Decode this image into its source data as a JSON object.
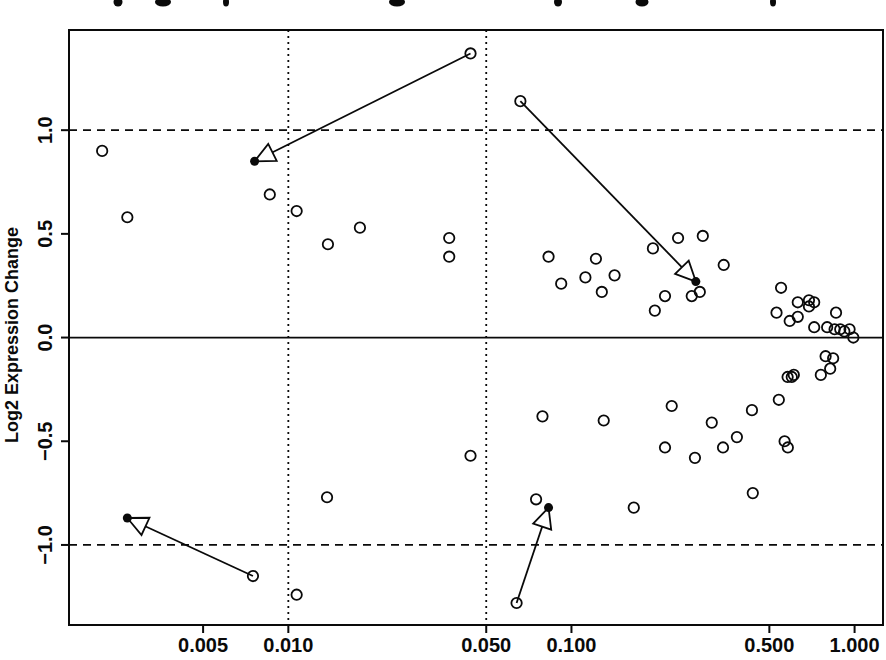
{
  "chart_data": {
    "type": "scatter",
    "title": "",
    "title_clipped_at_top": true,
    "xlabel": "",
    "ylabel": "Log2 Expression Change",
    "x_scale": "log10",
    "xlim": [
      0.00168,
      1.26
    ],
    "ylim": [
      -1.386,
      1.483
    ],
    "grid": false,
    "x_ticks": [
      0.005,
      0.01,
      0.05,
      0.1,
      0.5,
      1.0
    ],
    "x_tick_labels": [
      "0.005",
      "0.010",
      "0.050",
      "0.100",
      "0.500",
      "1.000"
    ],
    "y_ticks": [
      1.0,
      0.5,
      0.0,
      -0.5,
      -1.0
    ],
    "y_tick_labels": [
      "1.0",
      "0.5",
      "0.0",
      "−0.5",
      "−1.0"
    ],
    "reference_lines": {
      "horizontal_solid": [
        0
      ],
      "horizontal_dashed": [
        1.0,
        -1.0
      ],
      "vertical_dotted": [
        0.01,
        0.05
      ]
    },
    "points": [
      [
        0.0022,
        0.9
      ],
      [
        0.0027,
        0.58
      ],
      [
        0.0086,
        0.69
      ],
      [
        0.0107,
        0.61
      ],
      [
        0.0138,
        0.45
      ],
      [
        0.0179,
        0.53
      ],
      [
        0.037,
        0.48
      ],
      [
        0.037,
        0.39
      ],
      [
        0.083,
        0.39
      ],
      [
        0.092,
        0.26
      ],
      [
        0.112,
        0.29
      ],
      [
        0.122,
        0.38
      ],
      [
        0.128,
        0.22
      ],
      [
        0.142,
        0.3
      ],
      [
        0.194,
        0.43
      ],
      [
        0.197,
        0.13
      ],
      [
        0.214,
        0.2
      ],
      [
        0.238,
        0.48
      ],
      [
        0.266,
        0.2
      ],
      [
        0.284,
        0.22
      ],
      [
        0.291,
        0.49
      ],
      [
        0.345,
        0.35
      ],
      [
        0.53,
        0.12
      ],
      [
        0.55,
        0.24
      ],
      [
        0.59,
        0.08
      ],
      [
        0.63,
        0.17
      ],
      [
        0.63,
        0.1
      ],
      [
        0.69,
        0.18
      ],
      [
        0.69,
        0.15
      ],
      [
        0.72,
        0.17
      ],
      [
        0.72,
        0.05
      ],
      [
        0.8,
        0.05
      ],
      [
        0.85,
        0.04
      ],
      [
        0.86,
        0.12
      ],
      [
        0.89,
        0.04
      ],
      [
        0.92,
        0.03
      ],
      [
        0.96,
        0.04
      ],
      [
        0.99,
        0.0
      ],
      [
        0.79,
        -0.09
      ],
      [
        0.84,
        -0.1
      ],
      [
        0.82,
        -0.15
      ],
      [
        0.76,
        -0.18
      ],
      [
        0.58,
        -0.19
      ],
      [
        0.6,
        -0.19
      ],
      [
        0.61,
        -0.18
      ],
      [
        0.54,
        -0.3
      ],
      [
        0.079,
        -0.38
      ],
      [
        0.13,
        -0.4
      ],
      [
        0.226,
        -0.33
      ],
      [
        0.313,
        -0.41
      ],
      [
        0.214,
        -0.53
      ],
      [
        0.273,
        -0.58
      ],
      [
        0.343,
        -0.53
      ],
      [
        0.384,
        -0.48
      ],
      [
        0.434,
        -0.35
      ],
      [
        0.566,
        -0.5
      ],
      [
        0.581,
        -0.53
      ],
      [
        0.437,
        -0.75
      ],
      [
        0.075,
        -0.78
      ],
      [
        0.166,
        -0.82
      ],
      [
        0.044,
        -0.57
      ],
      [
        0.0137,
        -0.77
      ],
      [
        0.0107,
        -1.24
      ],
      [
        0.044,
        1.37
      ],
      [
        0.066,
        1.14
      ],
      [
        0.0075,
        -1.15
      ],
      [
        0.064,
        -1.28
      ]
    ],
    "arrows": [
      {
        "from": [
          0.044,
          1.37
        ],
        "to": [
          0.0076,
          0.85
        ]
      },
      {
        "from": [
          0.066,
          1.14
        ],
        "to": [
          0.275,
          0.27
        ]
      },
      {
        "from": [
          0.0075,
          -1.15
        ],
        "to": [
          0.0027,
          -0.87
        ]
      },
      {
        "from": [
          0.064,
          -1.28
        ],
        "to": [
          0.083,
          -0.82
        ]
      }
    ],
    "legend": null
  },
  "clipped_title_marks": [
    {
      "x": 118,
      "w": 9
    },
    {
      "x": 163,
      "w": 16
    },
    {
      "x": 226,
      "w": 6
    },
    {
      "x": 397,
      "w": 16
    },
    {
      "x": 558,
      "w": 8
    },
    {
      "x": 642,
      "w": 13
    },
    {
      "x": 773,
      "w": 6
    }
  ],
  "colors": {
    "ink": "#0a0a0a",
    "background": "#ffffff"
  }
}
